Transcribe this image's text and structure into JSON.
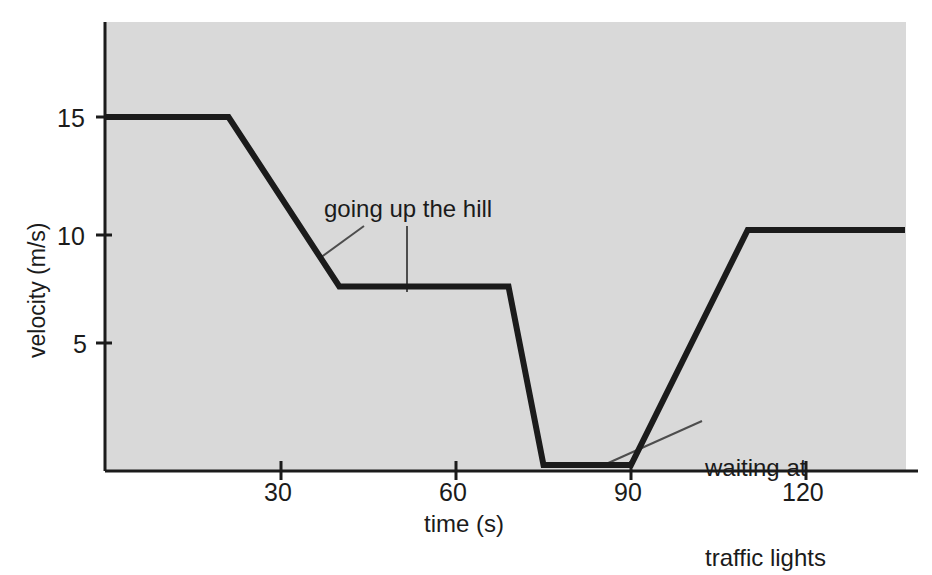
{
  "chart_data": {
    "type": "line",
    "title": "",
    "xlabel": "time (s)",
    "ylabel": "velocity (m/s)",
    "xlim": [
      0,
      138
    ],
    "ylim": [
      0,
      19.6
    ],
    "xticks": [
      30,
      60,
      90,
      120
    ],
    "xtick_labels": [
      "30",
      "60",
      "90",
      "120"
    ],
    "yticks": [
      5,
      10,
      15
    ],
    "ytick_labels": [
      "5",
      "10",
      "15"
    ],
    "grid": false,
    "legend": null,
    "series": [
      {
        "name": "velocity",
        "x": [
          0,
          21,
          40,
          69,
          75,
          90,
          110,
          137
        ],
        "values": [
          15,
          15,
          7.5,
          7.5,
          0,
          0,
          10,
          10
        ]
      }
    ],
    "annotations": [
      {
        "text": "going up the hill",
        "x_text": 38,
        "y_text": 11.9,
        "leaders": [
          {
            "from_x": 44.2,
            "from_y": 11.4,
            "to_x": 36.6,
            "to_y": 8.55
          },
          {
            "from_x": 51.5,
            "from_y": 11.4,
            "to_x": 51.5,
            "to_y": 7.5
          }
        ]
      },
      {
        "text_line1": "waiting at",
        "text_line2": "traffic lights",
        "x_text": 103,
        "y_text": 4.0,
        "leaders": [
          {
            "from_x": 102.2,
            "from_y": 3.1,
            "to_x": 85.7,
            "to_y": 0.1
          }
        ]
      }
    ],
    "colors": {
      "plot_background": "#d9d9d9",
      "page_background": "#ffffff",
      "line": "#1b1b1b",
      "axis": "#1b1b1b",
      "text": "#1b1b1b",
      "leader_line": "#4d4d4d"
    }
  }
}
